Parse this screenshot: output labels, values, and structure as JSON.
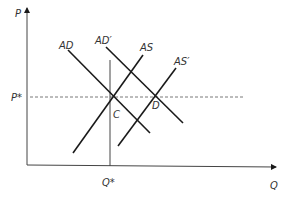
{
  "diagram": {
    "axes": {
      "y_label": "P",
      "x_label": "Q",
      "origin": [
        27,
        165
      ],
      "y_top": 6,
      "x_right": 276
    },
    "reference_lines": {
      "price": {
        "label": "P*",
        "y": 97,
        "style": "dashed"
      },
      "quantity": {
        "label": "Q*",
        "x": 110,
        "style": "solid"
      }
    },
    "curves": [
      {
        "label": "AD",
        "from": [
          68,
          50
        ],
        "to": [
          150,
          133
        ]
      },
      {
        "label": "AD′",
        "from": [
          106,
          47
        ],
        "to": [
          183,
          123
        ]
      },
      {
        "label": "AS",
        "from": [
          73,
          153
        ],
        "to": [
          143,
          55
        ]
      },
      {
        "label": "AS′",
        "from": [
          118,
          146
        ],
        "to": [
          176,
          68
        ]
      }
    ],
    "points": [
      {
        "label": "C",
        "x": 111,
        "y": 97
      },
      {
        "label": "D",
        "x": 156,
        "y": 97
      }
    ],
    "colors": {
      "line": "#1a1a1a",
      "axis": "#444444",
      "text": "#333333"
    }
  }
}
